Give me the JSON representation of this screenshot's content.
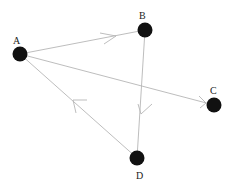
{
  "diagram": {
    "type": "directed-graph",
    "nodes": [
      {
        "id": "A",
        "label": "A",
        "x": 20,
        "y": 54,
        "label_x": 15,
        "label_y": 42
      },
      {
        "id": "B",
        "label": "B",
        "x": 145,
        "y": 30,
        "label_x": 142,
        "label_y": 18
      },
      {
        "id": "C",
        "label": "C",
        "x": 214,
        "y": 105,
        "label_x": 212,
        "label_y": 94
      },
      {
        "id": "D",
        "label": "D",
        "x": 137,
        "y": 158,
        "label_x": 138,
        "label_y": 178
      }
    ],
    "edges": [
      {
        "from": "A",
        "to": "B"
      },
      {
        "from": "A",
        "to": "C"
      },
      {
        "from": "B",
        "to": "D"
      },
      {
        "from": "D",
        "to": "A"
      }
    ],
    "colors": {
      "node": "#111111",
      "edge": "#b5b5b5",
      "label": "#222222"
    }
  }
}
